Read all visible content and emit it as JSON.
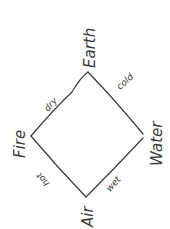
{
  "diagram": {
    "title": "",
    "stroke_color": "#3a3a3a",
    "background": "#ffffff",
    "nodes": [
      {
        "id": "earth",
        "label": "Earth",
        "x": 88,
        "y": 72
      },
      {
        "id": "water",
        "label": "Water",
        "x": 143,
        "y": 136
      },
      {
        "id": "air",
        "label": "Air",
        "x": 86,
        "y": 197
      },
      {
        "id": "fire",
        "label": "Fire",
        "x": 31,
        "y": 136
      }
    ],
    "edges": [
      {
        "from": "fire",
        "to": "earth",
        "label": "dry"
      },
      {
        "from": "earth",
        "to": "water",
        "label": "cold"
      },
      {
        "from": "fire",
        "to": "air",
        "label": "hot"
      },
      {
        "from": "air",
        "to": "water",
        "label": "wet"
      }
    ]
  }
}
